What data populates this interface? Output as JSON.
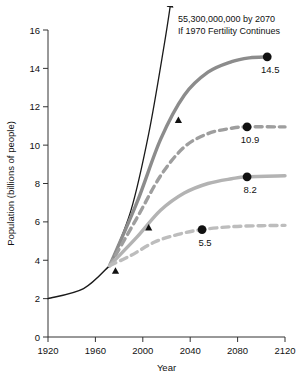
{
  "chart_data": {
    "type": "line",
    "title": "",
    "xlabel": "Year",
    "ylabel": "Population (billions of people)",
    "xlim": [
      1920,
      2120
    ],
    "ylim": [
      0,
      16
    ],
    "xticks": [
      1920,
      1960,
      2000,
      2040,
      2080,
      2120
    ],
    "xtick_labels": [
      "1920",
      "1960",
      "2000",
      "2040",
      "2080",
      "2120"
    ],
    "yticks": [
      0,
      2,
      4,
      6,
      8,
      10,
      12,
      14,
      16
    ],
    "ytick_labels": [
      "0",
      "2",
      "4",
      "6",
      "8",
      "10",
      "12",
      "14",
      "16"
    ],
    "grid": false,
    "legend": "none",
    "annotations": [
      {
        "name": "unchecked-growth-annotation",
        "line1": "55,300,000,000 by 2070",
        "line2": "If 1970 Fertility Continues"
      }
    ],
    "series": [
      {
        "name": "historical",
        "style": "solid",
        "color": "#1a1a1a",
        "width": 1.4,
        "points": [
          [
            1920,
            2.0
          ],
          [
            1950,
            2.52
          ],
          [
            1972,
            3.72
          ]
        ]
      },
      {
        "name": "1970-fertility-continues",
        "style": "solid",
        "color": "#1a1a1a",
        "width": 1.3,
        "arrow": true,
        "end_value": "55,300,000,000 by 2070",
        "points": [
          [
            1972,
            3.72
          ],
          [
            1990,
            6.6
          ],
          [
            2005,
            10.6
          ],
          [
            2018,
            15.2
          ],
          [
            2024,
            17.6
          ]
        ]
      },
      {
        "name": "projection-14.5",
        "style": "solid",
        "color": "#8c8c8c",
        "width": 3.4,
        "end_label": "14.5",
        "end_point": [
          2105,
          14.6
        ],
        "points": [
          [
            1972,
            3.72
          ],
          [
            1995,
            7.0
          ],
          [
            2015,
            10.3
          ],
          [
            2035,
            12.6
          ],
          [
            2055,
            13.8
          ],
          [
            2075,
            14.35
          ],
          [
            2090,
            14.55
          ],
          [
            2105,
            14.6
          ]
        ]
      },
      {
        "name": "projection-10.9",
        "style": "dashed",
        "color": "#9e9e9e",
        "width": 3.4,
        "end_label": "10.9",
        "end_point": [
          2088,
          10.95
        ],
        "points": [
          [
            1972,
            3.72
          ],
          [
            1995,
            6.2
          ],
          [
            2015,
            8.4
          ],
          [
            2035,
            9.9
          ],
          [
            2055,
            10.6
          ],
          [
            2075,
            10.88
          ],
          [
            2088,
            10.95
          ],
          [
            2120,
            10.95
          ]
        ]
      },
      {
        "name": "projection-8.2",
        "style": "solid",
        "color": "#b3b3b3",
        "width": 3.4,
        "end_label": "8.2",
        "end_point": [
          2088,
          8.35
        ],
        "points": [
          [
            1972,
            3.72
          ],
          [
            1995,
            5.2
          ],
          [
            2015,
            6.6
          ],
          [
            2035,
            7.5
          ],
          [
            2055,
            8.0
          ],
          [
            2075,
            8.25
          ],
          [
            2088,
            8.35
          ],
          [
            2120,
            8.4
          ]
        ]
      },
      {
        "name": "projection-5.5",
        "style": "dashed",
        "color": "#bdbdbd",
        "width": 3.4,
        "end_label": "5.5",
        "end_point": [
          2050,
          5.6
        ],
        "points": [
          [
            1972,
            3.72
          ],
          [
            1990,
            4.25
          ],
          [
            2010,
            4.95
          ],
          [
            2030,
            5.35
          ],
          [
            2050,
            5.6
          ],
          [
            2075,
            5.75
          ],
          [
            2100,
            5.8
          ],
          [
            2120,
            5.82
          ]
        ]
      }
    ],
    "markers": {
      "triangles": {
        "name": "actual-data-marker",
        "shape": "triangle",
        "color": "#111111",
        "points": [
          [
            1977,
            3.45
          ],
          [
            2005,
            5.7
          ],
          [
            2030,
            11.3
          ]
        ]
      },
      "dots": {
        "name": "endpoint-marker",
        "shape": "circle",
        "color": "#111111",
        "points": [
          [
            2105,
            14.6
          ],
          [
            2088,
            10.95
          ],
          [
            2088,
            8.35
          ],
          [
            2050,
            5.6
          ]
        ]
      }
    }
  }
}
